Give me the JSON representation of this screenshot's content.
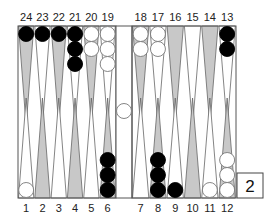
{
  "board": {
    "colors": {
      "background": "#ffffff",
      "frame": "#555555",
      "point_dark": "#c8c8c8",
      "point_light": "#ffffff",
      "black_checker": "#000000",
      "white_checker": "#ffffff",
      "checker_outline": "#777777"
    },
    "top_points": [
      {
        "point": 24,
        "label": "24",
        "shade": "dark",
        "checkers": 1,
        "color": "black"
      },
      {
        "point": 23,
        "label": "23",
        "shade": "light",
        "checkers": 1,
        "color": "black"
      },
      {
        "point": 22,
        "label": "22",
        "shade": "dark",
        "checkers": 1,
        "color": "black"
      },
      {
        "point": 21,
        "label": "21",
        "shade": "light",
        "checkers": 3,
        "color": "black"
      },
      {
        "point": 20,
        "label": "20",
        "shade": "dark",
        "checkers": 2,
        "color": "white"
      },
      {
        "point": 19,
        "label": "19",
        "shade": "light",
        "checkers": 3,
        "color": "white"
      },
      {
        "point": 18,
        "label": "18",
        "shade": "dark",
        "checkers": 2,
        "color": "white"
      },
      {
        "point": 17,
        "label": "17",
        "shade": "light",
        "checkers": 2,
        "color": "white"
      },
      {
        "point": 16,
        "label": "16",
        "shade": "dark",
        "checkers": 0,
        "color": null
      },
      {
        "point": 15,
        "label": "15",
        "shade": "light",
        "checkers": 0,
        "color": null
      },
      {
        "point": 14,
        "label": "14",
        "shade": "dark",
        "checkers": 0,
        "color": null
      },
      {
        "point": 13,
        "label": "13",
        "shade": "light",
        "checkers": 2,
        "color": "black"
      }
    ],
    "bottom_points": [
      {
        "point": 1,
        "label": "1",
        "shade": "light",
        "checkers": 1,
        "color": "white"
      },
      {
        "point": 2,
        "label": "2",
        "shade": "dark",
        "checkers": 0,
        "color": null
      },
      {
        "point": 3,
        "label": "3",
        "shade": "light",
        "checkers": 0,
        "color": null
      },
      {
        "point": 4,
        "label": "4",
        "shade": "dark",
        "checkers": 0,
        "color": null
      },
      {
        "point": 5,
        "label": "5",
        "shade": "light",
        "checkers": 0,
        "color": null
      },
      {
        "point": 6,
        "label": "6",
        "shade": "dark",
        "checkers": 3,
        "color": "black"
      },
      {
        "point": 7,
        "label": "7",
        "shade": "light",
        "checkers": 0,
        "color": null
      },
      {
        "point": 8,
        "label": "8",
        "shade": "dark",
        "checkers": 3,
        "color": "black"
      },
      {
        "point": 9,
        "label": "9",
        "shade": "light",
        "checkers": 1,
        "color": "black"
      },
      {
        "point": 10,
        "label": "10",
        "shade": "dark",
        "checkers": 0,
        "color": null
      },
      {
        "point": 11,
        "label": "11",
        "shade": "light",
        "checkers": 1,
        "color": "white"
      },
      {
        "point": 12,
        "label": "12",
        "shade": "dark",
        "checkers": 3,
        "color": "white"
      }
    ],
    "bar": {
      "white_checkers": 1,
      "black_checkers": 0
    }
  },
  "doubling_cube": {
    "value": "2"
  }
}
